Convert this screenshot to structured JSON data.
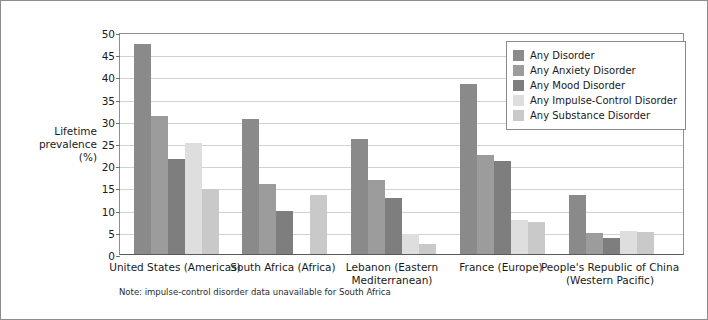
{
  "chart_data": {
    "type": "bar",
    "title": "",
    "xlabel": "",
    "ylabel": "Lifetime prevalence (%)",
    "ylabel_lines": [
      "Lifetime",
      "prevalence",
      "(%)"
    ],
    "ylim": [
      0,
      50
    ],
    "yticks": [
      0,
      5,
      10,
      15,
      20,
      25,
      30,
      35,
      40,
      45,
      50
    ],
    "ytick_labels": [
      "0",
      "5",
      "10",
      "15",
      "20",
      "25",
      "30",
      "35",
      "40",
      "45",
      "50"
    ],
    "grid": true,
    "legend_position": "top-right",
    "categories": [
      "United States (Americas)",
      "South Africa (Africa)",
      "Lebanon (Eastern Mediterranean)",
      "France (Europe)",
      "People's Republic of China (Western Pacific)"
    ],
    "category_lines": [
      [
        "United States (Americas)"
      ],
      [
        "South Africa (Africa)"
      ],
      [
        "Lebanon (Eastern",
        "Mediterranean)"
      ],
      [
        "France (Europe)"
      ],
      [
        "People's Republic of China",
        "(Western Pacific)"
      ]
    ],
    "series": [
      {
        "name": "Any Disorder",
        "color": "#8a8a8a",
        "values": [
          47.4,
          30.3,
          26.0,
          38.4,
          13.2
        ]
      },
      {
        "name": "Any Anxiety Disorder",
        "color": "#9c9c9c",
        "values": [
          31.0,
          15.8,
          16.7,
          22.3,
          4.8
        ]
      },
      {
        "name": "Any Mood Disorder",
        "color": "#7e7e7e",
        "values": [
          21.4,
          9.8,
          12.6,
          21.0,
          3.6
        ]
      },
      {
        "name": "Any Impulse-Control Disorder",
        "color": "#dedede",
        "values": [
          25.0,
          null,
          4.4,
          7.6,
          5.2
        ]
      },
      {
        "name": "Any Substance Disorder",
        "color": "#c9c9c9",
        "values": [
          14.6,
          13.3,
          2.2,
          7.1,
          4.9
        ]
      }
    ],
    "annotations": [
      "Note: impulse-control disorder data unavailable for South Africa"
    ]
  },
  "footnote": "Note: impulse-control disorder data unavailable for South Africa",
  "colors": {
    "border": "#8c8c8c",
    "gridline": "#d2d2d2",
    "axis": "#5a5a5a",
    "background": "#ffffff",
    "text": "#1a1a1a"
  }
}
